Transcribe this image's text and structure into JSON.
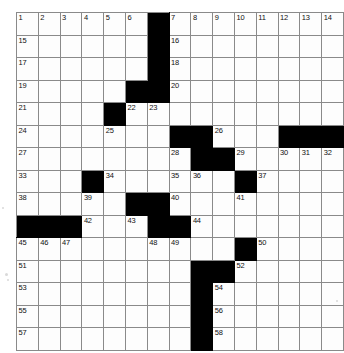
{
  "document": {
    "type": "crossword-puzzle",
    "title": "Crossword Puzzle Grid",
    "grid": {
      "columns": 15,
      "rows": 15,
      "cell_fill_color": "#ffffff",
      "block_color": "#000000",
      "line_color": "#8a8a8a",
      "number_color": "#111111"
    }
  },
  "chart_data": {
    "type": "table",
    "columns": 15,
    "rows": 15,
    "legend": [
      "white = fillable cell",
      "black = block"
    ],
    "cells": [
      [
        {
          "block": false,
          "num": "1"
        },
        {
          "block": false,
          "num": "2"
        },
        {
          "block": false,
          "num": "3"
        },
        {
          "block": false,
          "num": "4"
        },
        {
          "block": false,
          "num": "5"
        },
        {
          "block": false,
          "num": "6"
        },
        {
          "block": true,
          "num": ""
        },
        {
          "block": false,
          "num": "7"
        },
        {
          "block": false,
          "num": "8"
        },
        {
          "block": false,
          "num": "9"
        },
        {
          "block": false,
          "num": "10"
        },
        {
          "block": false,
          "num": "11"
        },
        {
          "block": false,
          "num": "12"
        },
        {
          "block": false,
          "num": "13"
        },
        {
          "block": false,
          "num": "14"
        }
      ],
      [
        {
          "block": false,
          "num": "15"
        },
        {
          "block": false,
          "num": ""
        },
        {
          "block": false,
          "num": ""
        },
        {
          "block": false,
          "num": ""
        },
        {
          "block": false,
          "num": ""
        },
        {
          "block": false,
          "num": ""
        },
        {
          "block": true,
          "num": ""
        },
        {
          "block": false,
          "num": "16"
        },
        {
          "block": false,
          "num": ""
        },
        {
          "block": false,
          "num": ""
        },
        {
          "block": false,
          "num": ""
        },
        {
          "block": false,
          "num": ""
        },
        {
          "block": false,
          "num": ""
        },
        {
          "block": false,
          "num": ""
        },
        {
          "block": false,
          "num": ""
        }
      ],
      [
        {
          "block": false,
          "num": "17"
        },
        {
          "block": false,
          "num": ""
        },
        {
          "block": false,
          "num": ""
        },
        {
          "block": false,
          "num": ""
        },
        {
          "block": false,
          "num": ""
        },
        {
          "block": false,
          "num": ""
        },
        {
          "block": true,
          "num": ""
        },
        {
          "block": false,
          "num": "18"
        },
        {
          "block": false,
          "num": ""
        },
        {
          "block": false,
          "num": ""
        },
        {
          "block": false,
          "num": ""
        },
        {
          "block": false,
          "num": ""
        },
        {
          "block": false,
          "num": ""
        },
        {
          "block": false,
          "num": ""
        },
        {
          "block": false,
          "num": ""
        }
      ],
      [
        {
          "block": false,
          "num": "19"
        },
        {
          "block": false,
          "num": ""
        },
        {
          "block": false,
          "num": ""
        },
        {
          "block": false,
          "num": ""
        },
        {
          "block": false,
          "num": ""
        },
        {
          "block": true,
          "num": ""
        },
        {
          "block": true,
          "num": ""
        },
        {
          "block": false,
          "num": "20"
        },
        {
          "block": false,
          "num": ""
        },
        {
          "block": false,
          "num": ""
        },
        {
          "block": false,
          "num": ""
        },
        {
          "block": false,
          "num": ""
        },
        {
          "block": false,
          "num": ""
        },
        {
          "block": false,
          "num": ""
        },
        {
          "block": false,
          "num": ""
        }
      ],
      [
        {
          "block": false,
          "num": "21"
        },
        {
          "block": false,
          "num": ""
        },
        {
          "block": false,
          "num": ""
        },
        {
          "block": false,
          "num": ""
        },
        {
          "block": true,
          "num": ""
        },
        {
          "block": false,
          "num": "22"
        },
        {
          "block": false,
          "num": "23"
        },
        {
          "block": false,
          "num": ""
        },
        {
          "block": false,
          "num": ""
        },
        {
          "block": false,
          "num": ""
        },
        {
          "block": false,
          "num": ""
        },
        {
          "block": false,
          "num": ""
        },
        {
          "block": false,
          "num": ""
        },
        {
          "block": false,
          "num": ""
        },
        {
          "block": false,
          "num": ""
        }
      ],
      [
        {
          "block": false,
          "num": "24"
        },
        {
          "block": false,
          "num": ""
        },
        {
          "block": false,
          "num": ""
        },
        {
          "block": false,
          "num": ""
        },
        {
          "block": false,
          "num": "25"
        },
        {
          "block": false,
          "num": ""
        },
        {
          "block": false,
          "num": ""
        },
        {
          "block": true,
          "num": ""
        },
        {
          "block": true,
          "num": ""
        },
        {
          "block": false,
          "num": "26"
        },
        {
          "block": false,
          "num": ""
        },
        {
          "block": false,
          "num": ""
        },
        {
          "block": true,
          "num": ""
        },
        {
          "block": true,
          "num": ""
        },
        {
          "block": true,
          "num": ""
        }
      ],
      [
        {
          "block": false,
          "num": "27"
        },
        {
          "block": false,
          "num": ""
        },
        {
          "block": false,
          "num": ""
        },
        {
          "block": false,
          "num": ""
        },
        {
          "block": false,
          "num": ""
        },
        {
          "block": false,
          "num": ""
        },
        {
          "block": false,
          "num": ""
        },
        {
          "block": false,
          "num": "28"
        },
        {
          "block": true,
          "num": ""
        },
        {
          "block": true,
          "num": ""
        },
        {
          "block": false,
          "num": "29"
        },
        {
          "block": false,
          "num": ""
        },
        {
          "block": false,
          "num": "30"
        },
        {
          "block": false,
          "num": "31"
        },
        {
          "block": false,
          "num": "32"
        }
      ],
      [
        {
          "block": false,
          "num": "33"
        },
        {
          "block": false,
          "num": ""
        },
        {
          "block": false,
          "num": ""
        },
        {
          "block": true,
          "num": ""
        },
        {
          "block": false,
          "num": "34"
        },
        {
          "block": false,
          "num": ""
        },
        {
          "block": false,
          "num": ""
        },
        {
          "block": false,
          "num": "35"
        },
        {
          "block": false,
          "num": "36"
        },
        {
          "block": false,
          "num": ""
        },
        {
          "block": true,
          "num": ""
        },
        {
          "block": false,
          "num": "37"
        },
        {
          "block": false,
          "num": ""
        },
        {
          "block": false,
          "num": ""
        },
        {
          "block": false,
          "num": ""
        }
      ],
      [
        {
          "block": false,
          "num": "38"
        },
        {
          "block": false,
          "num": ""
        },
        {
          "block": false,
          "num": ""
        },
        {
          "block": false,
          "num": "39"
        },
        {
          "block": false,
          "num": ""
        },
        {
          "block": true,
          "num": ""
        },
        {
          "block": true,
          "num": ""
        },
        {
          "block": false,
          "num": "40"
        },
        {
          "block": false,
          "num": ""
        },
        {
          "block": false,
          "num": ""
        },
        {
          "block": false,
          "num": "41"
        },
        {
          "block": false,
          "num": ""
        },
        {
          "block": false,
          "num": ""
        },
        {
          "block": false,
          "num": ""
        },
        {
          "block": false,
          "num": ""
        }
      ],
      [
        {
          "block": true,
          "num": ""
        },
        {
          "block": true,
          "num": ""
        },
        {
          "block": true,
          "num": ""
        },
        {
          "block": false,
          "num": "42"
        },
        {
          "block": false,
          "num": ""
        },
        {
          "block": false,
          "num": "43"
        },
        {
          "block": true,
          "num": ""
        },
        {
          "block": true,
          "num": ""
        },
        {
          "block": false,
          "num": "44"
        },
        {
          "block": false,
          "num": ""
        },
        {
          "block": false,
          "num": ""
        },
        {
          "block": false,
          "num": ""
        },
        {
          "block": false,
          "num": ""
        },
        {
          "block": false,
          "num": ""
        },
        {
          "block": false,
          "num": ""
        }
      ],
      [
        {
          "block": false,
          "num": "45"
        },
        {
          "block": false,
          "num": "46"
        },
        {
          "block": false,
          "num": "47"
        },
        {
          "block": false,
          "num": ""
        },
        {
          "block": false,
          "num": ""
        },
        {
          "block": false,
          "num": ""
        },
        {
          "block": false,
          "num": "48"
        },
        {
          "block": false,
          "num": "49"
        },
        {
          "block": false,
          "num": ""
        },
        {
          "block": false,
          "num": ""
        },
        {
          "block": true,
          "num": ""
        },
        {
          "block": false,
          "num": "50"
        },
        {
          "block": false,
          "num": ""
        },
        {
          "block": false,
          "num": ""
        },
        {
          "block": false,
          "num": ""
        }
      ],
      [
        {
          "block": false,
          "num": "51"
        },
        {
          "block": false,
          "num": ""
        },
        {
          "block": false,
          "num": ""
        },
        {
          "block": false,
          "num": ""
        },
        {
          "block": false,
          "num": ""
        },
        {
          "block": false,
          "num": ""
        },
        {
          "block": false,
          "num": ""
        },
        {
          "block": false,
          "num": ""
        },
        {
          "block": true,
          "num": ""
        },
        {
          "block": true,
          "num": ""
        },
        {
          "block": false,
          "num": "52"
        },
        {
          "block": false,
          "num": ""
        },
        {
          "block": false,
          "num": ""
        },
        {
          "block": false,
          "num": ""
        },
        {
          "block": false,
          "num": ""
        }
      ],
      [
        {
          "block": false,
          "num": "53"
        },
        {
          "block": false,
          "num": ""
        },
        {
          "block": false,
          "num": ""
        },
        {
          "block": false,
          "num": ""
        },
        {
          "block": false,
          "num": ""
        },
        {
          "block": false,
          "num": ""
        },
        {
          "block": false,
          "num": ""
        },
        {
          "block": false,
          "num": ""
        },
        {
          "block": true,
          "num": ""
        },
        {
          "block": false,
          "num": "54"
        },
        {
          "block": false,
          "num": ""
        },
        {
          "block": false,
          "num": ""
        },
        {
          "block": false,
          "num": ""
        },
        {
          "block": false,
          "num": ""
        },
        {
          "block": false,
          "num": ""
        }
      ],
      [
        {
          "block": false,
          "num": "55"
        },
        {
          "block": false,
          "num": ""
        },
        {
          "block": false,
          "num": ""
        },
        {
          "block": false,
          "num": ""
        },
        {
          "block": false,
          "num": ""
        },
        {
          "block": false,
          "num": ""
        },
        {
          "block": false,
          "num": ""
        },
        {
          "block": false,
          "num": ""
        },
        {
          "block": true,
          "num": ""
        },
        {
          "block": false,
          "num": "56"
        },
        {
          "block": false,
          "num": ""
        },
        {
          "block": false,
          "num": ""
        },
        {
          "block": false,
          "num": ""
        },
        {
          "block": false,
          "num": ""
        },
        {
          "block": false,
          "num": ""
        }
      ],
      [
        {
          "block": false,
          "num": "57"
        },
        {
          "block": false,
          "num": ""
        },
        {
          "block": false,
          "num": ""
        },
        {
          "block": false,
          "num": ""
        },
        {
          "block": false,
          "num": ""
        },
        {
          "block": false,
          "num": ""
        },
        {
          "block": false,
          "num": ""
        },
        {
          "block": false,
          "num": ""
        },
        {
          "block": true,
          "num": ""
        },
        {
          "block": false,
          "num": "58"
        },
        {
          "block": false,
          "num": ""
        },
        {
          "block": false,
          "num": ""
        },
        {
          "block": false,
          "num": ""
        },
        {
          "block": false,
          "num": ""
        },
        {
          "block": false,
          "num": ""
        }
      ]
    ]
  }
}
